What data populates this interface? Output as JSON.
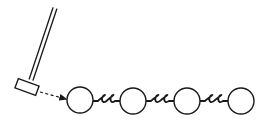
{
  "diagram": {
    "colors": {
      "background": "#ffffff",
      "ink": "#1a1a1a"
    },
    "hammer": {
      "icon": "hammer-icon",
      "handle": {
        "x1": 55,
        "y1": 8,
        "x2": 31,
        "y2": 80,
        "gap": 4
      },
      "head": {
        "cx": 27,
        "cy": 87,
        "w": 22,
        "h": 10,
        "rotate": 20
      }
    },
    "arrow": {
      "style": "dashed",
      "x1": 40,
      "y1": 92,
      "x2": 66,
      "y2": 99
    },
    "masses": [
      {
        "id": "mass-1",
        "cx": 80,
        "cy": 100,
        "r": 13
      },
      {
        "id": "mass-2",
        "cx": 133,
        "cy": 101,
        "r": 13
      },
      {
        "id": "mass-3",
        "cx": 187,
        "cy": 101,
        "r": 13
      },
      {
        "id": "mass-4",
        "cx": 241,
        "cy": 101,
        "r": 13
      }
    ],
    "springs": [
      {
        "id": "spring-1",
        "x1": 93,
        "x2": 120,
        "y": 101,
        "coils": 2
      },
      {
        "id": "spring-2",
        "x1": 146,
        "x2": 174,
        "y": 101,
        "coils": 2
      },
      {
        "id": "spring-3",
        "x1": 200,
        "x2": 228,
        "y": 101,
        "coils": 2
      }
    ]
  }
}
